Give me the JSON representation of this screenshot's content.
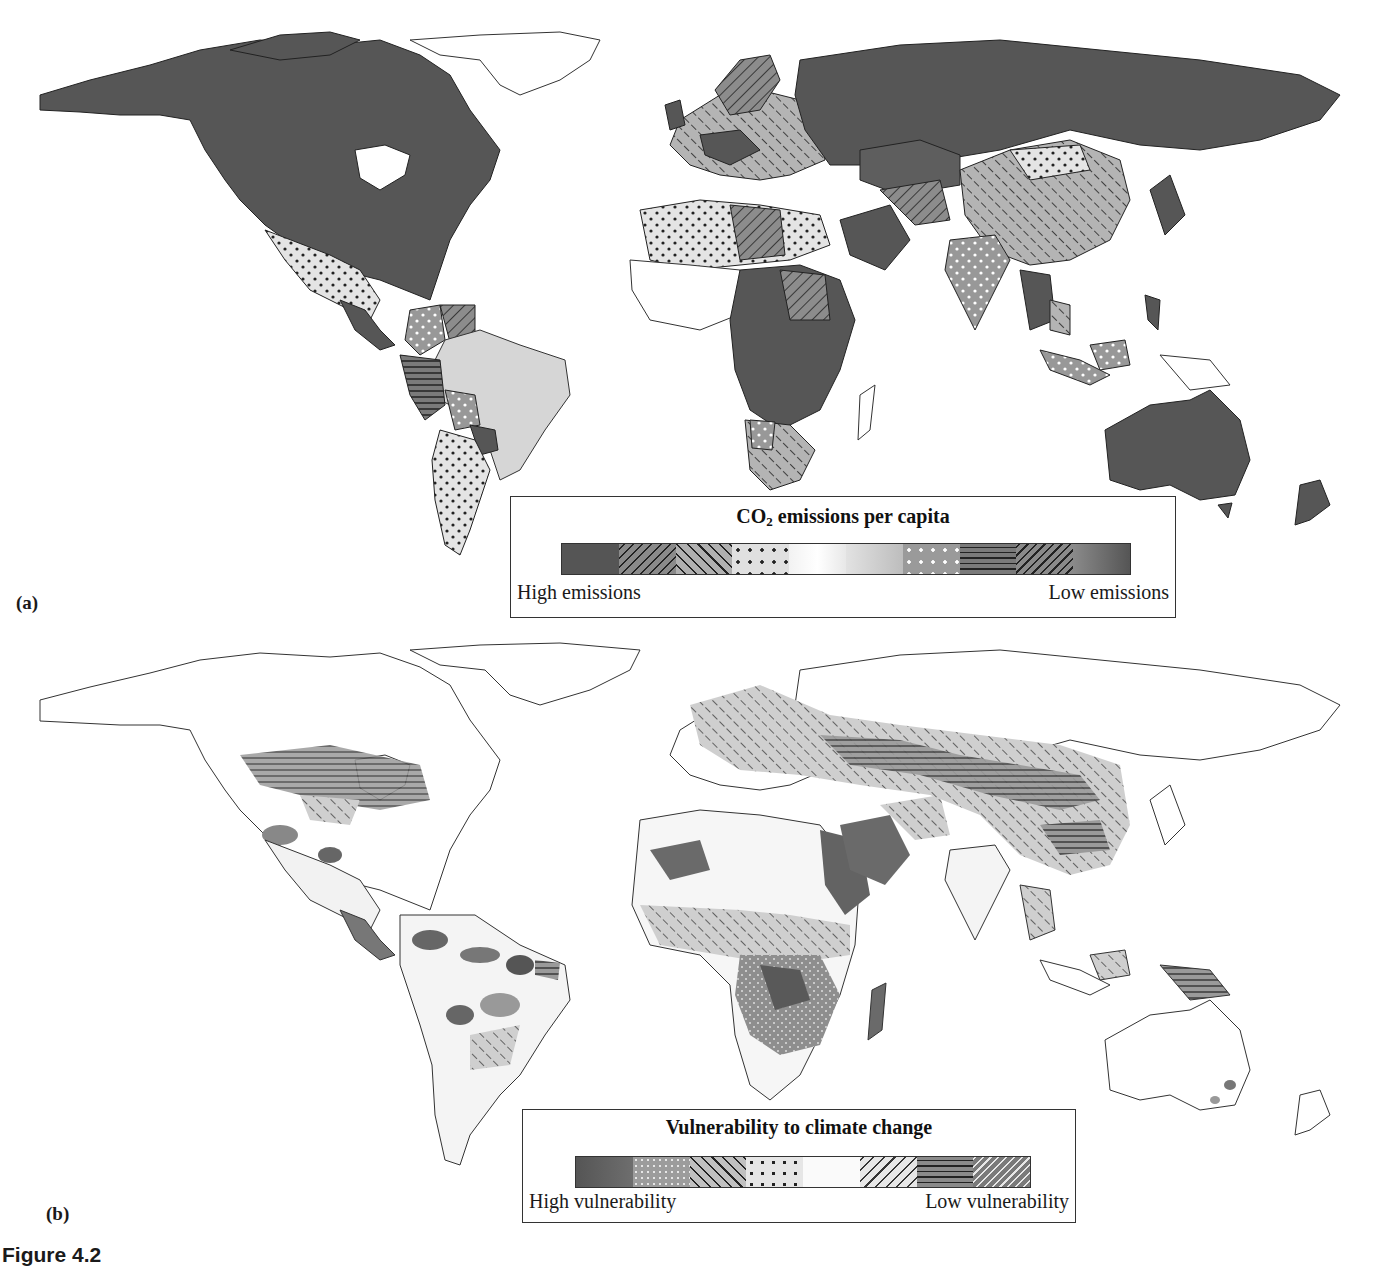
{
  "figure": {
    "caption": "Figure 4.2"
  },
  "panel_a": {
    "label": "(a)",
    "legend": {
      "title_prefix": "CO",
      "title_subscript": "2",
      "title_suffix": " emissions per capita",
      "left_label": "High emissions",
      "right_label": "Low emissions",
      "swatches": [
        {
          "pattern": "solid-dark",
          "color": "#555555"
        },
        {
          "pattern": "diag-right-dark",
          "color": "#8a8a8a"
        },
        {
          "pattern": "diag-left-dark",
          "color": "#b0b0b0"
        },
        {
          "pattern": "dots-dark",
          "color": "#dcdcdc"
        },
        {
          "pattern": "solid-white",
          "color": "#f8f8f8"
        },
        {
          "pattern": "gradient-light",
          "color": "#cfcfcf"
        },
        {
          "pattern": "dots-white",
          "color": "#9a9a9a"
        },
        {
          "pattern": "horizontal-lines",
          "color": "#7a7a7a"
        },
        {
          "pattern": "diag-right-bold",
          "color": "#7e7e7e"
        },
        {
          "pattern": "solid-mid",
          "color": "#6a6a6a"
        }
      ]
    }
  },
  "panel_b": {
    "label": "(b)",
    "legend": {
      "title": "Vulnerability to climate change",
      "left_label": "High vulnerability",
      "right_label": "Low vulnerability",
      "swatches": [
        {
          "pattern": "solid-dark",
          "color": "#5a5a5a"
        },
        {
          "pattern": "dots-white",
          "color": "#9c9c9c"
        },
        {
          "pattern": "diag-left-dark",
          "color": "#b8b8b8"
        },
        {
          "pattern": "dots-dark",
          "color": "#e2e2e2"
        },
        {
          "pattern": "solid-white",
          "color": "#fafafa"
        },
        {
          "pattern": "diag-right-dark",
          "color": "#d0d0d0"
        },
        {
          "pattern": "horizontal-lines",
          "color": "#8a8a8a"
        },
        {
          "pattern": "diag-right-white",
          "color": "#7a7a7a"
        }
      ]
    }
  },
  "colors": {
    "dark_fill": "#565656",
    "outline": "#333333",
    "light_fill": "#d6d6d6",
    "background": "#ffffff"
  }
}
